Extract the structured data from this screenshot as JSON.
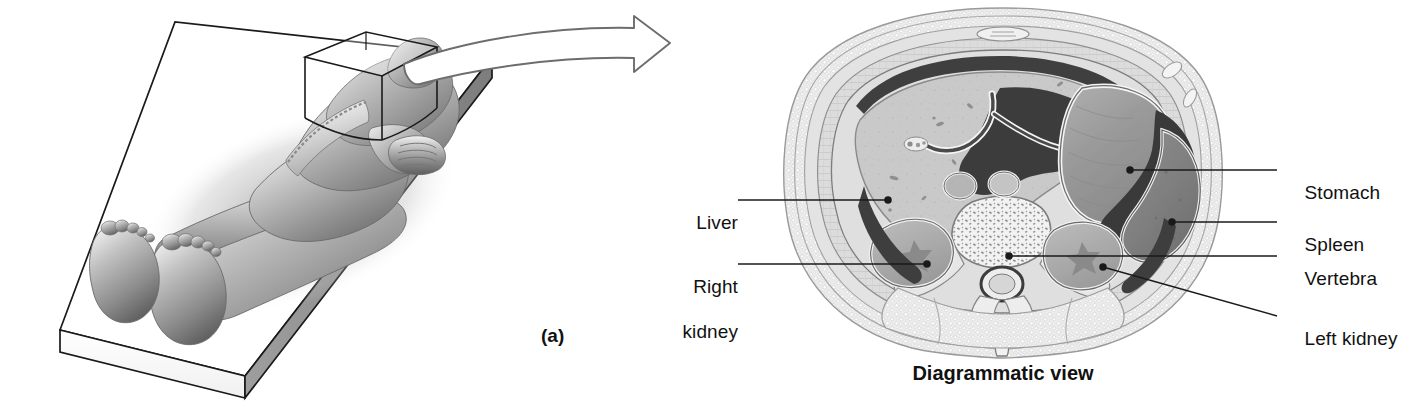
{
  "figure": {
    "panel_letter": "(a)",
    "caption": "Diagrammatic view",
    "background_color": "#ffffff",
    "ink_color": "#111111"
  },
  "panel_a": {
    "name": "supine-body-on-table",
    "description": "Person lying supine on a flat rectangular table with a transverse sectional plane drawn through the upper abdomen",
    "table_color": "#ffffff",
    "body_color": "#8c8c8c"
  },
  "transition_arrow": {
    "name": "curved-block-arrow",
    "direction": "right",
    "style": "hollow-outline",
    "stroke_color": "#5a5a5a"
  },
  "cross_section": {
    "title": "Transverse (cross) section of the abdomen",
    "view_label": "Diagrammatic view",
    "colors": {
      "skin_fat": "#e8e8e8",
      "muscle": "#c9c9c9",
      "liver": "#c6c6c6",
      "stomach": "#9d9d9d",
      "spleen": "#8a8a8a",
      "cavity_dark": "#4a4a4a",
      "bone": "#ededed",
      "outline": "#5f5f5f"
    },
    "labels_left": [
      {
        "id": "liver",
        "text": "Liver",
        "lines": [
          "Liver"
        ],
        "text_x": 683,
        "text_y": 190,
        "leader_from_x": 738,
        "leader_from_y": 200,
        "leader_to_x": 888,
        "leader_to_y": 200
      },
      {
        "id": "right-kidney",
        "text": "Right kidney",
        "lines": [
          "Right",
          "kidney"
        ],
        "text_x": 668,
        "text_y": 254,
        "leader_from_x": 738,
        "leader_from_y": 264,
        "leader_to_x": 927,
        "leader_to_y": 264
      }
    ],
    "labels_right": [
      {
        "id": "stomach",
        "text": "Stomach",
        "lines": [
          "Stomach"
        ],
        "text_x": 1283,
        "text_y": 160,
        "leader_from_x": 1130,
        "leader_from_y": 170,
        "leader_to_x": 1277,
        "leader_to_y": 170
      },
      {
        "id": "spleen",
        "text": "Spleen",
        "lines": [
          "Spleen"
        ],
        "text_x": 1283,
        "text_y": 212,
        "leader_from_x": 1172,
        "leader_from_y": 222,
        "leader_to_x": 1277,
        "leader_to_y": 222
      },
      {
        "id": "vertebra",
        "text": "Vertebra",
        "lines": [
          "Vertebra"
        ],
        "text_x": 1283,
        "text_y": 246,
        "leader_from_x": 1009,
        "leader_from_y": 256,
        "leader_to_x": 1277,
        "leader_to_y": 256
      },
      {
        "id": "left-kidney",
        "text": "Left kidney",
        "lines": [
          "Left kidney"
        ],
        "text_x": 1283,
        "text_y": 306,
        "leader_from_x": 1103,
        "leader_from_y": 267,
        "leader_to_x": 1277,
        "leader_to_y": 316
      }
    ]
  }
}
